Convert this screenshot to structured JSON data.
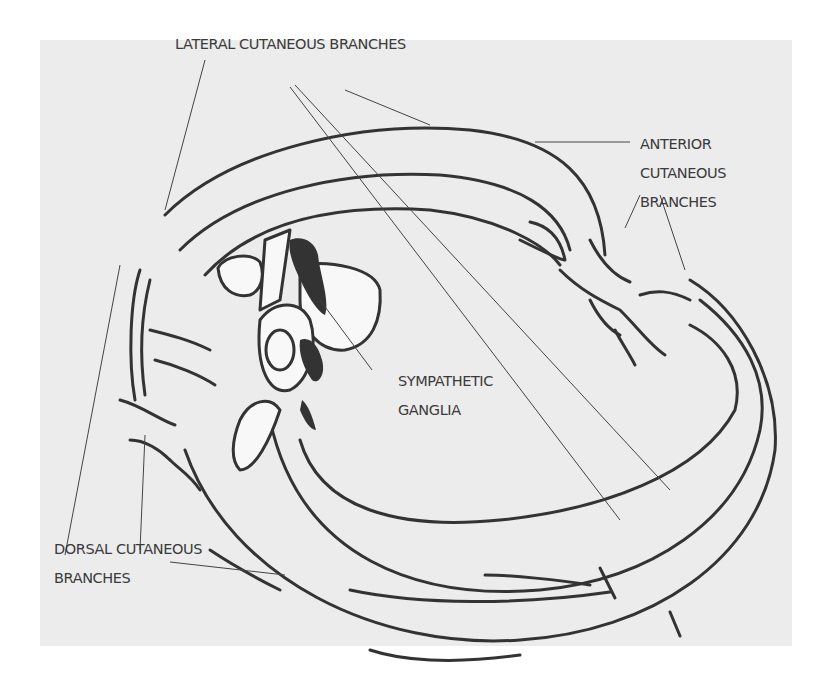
{
  "diagram": {
    "type": "anatomical-illustration",
    "background_color": "#ececec",
    "line_color": "#333333",
    "labels": {
      "lateral": {
        "line1": "LATERAL CUTANEOUS BRANCHES"
      },
      "anterior": {
        "line1": "ANTERIOR",
        "line2": "CUTANEOUS",
        "line3": "BRANCHES"
      },
      "sympathetic": {
        "line1": "SYMPATHETIC",
        "line2": "GANGLIA"
      },
      "dorsal": {
        "line1": "DORSAL CUTANEOUS",
        "line2": "BRANCHES"
      }
    }
  }
}
